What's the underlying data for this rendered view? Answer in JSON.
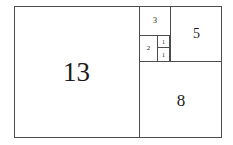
{
  "diagram": {
    "name": "fibonacci-squares",
    "type": "fibonacci-square-tiling",
    "background_color": "#ffffff",
    "line_color": "#4d4d4d",
    "text_color": "#1c1c1c",
    "frame": {
      "x": 14,
      "y": 6,
      "width": 208,
      "height": 132
    },
    "squares": [
      {
        "label": "13",
        "x": 14,
        "y": 6,
        "width": 126,
        "height": 132,
        "font_size": 27
      },
      {
        "label": "8",
        "x": 140,
        "y": 61,
        "width": 82,
        "height": 77,
        "font_size": 17
      },
      {
        "label": "5",
        "x": 170,
        "y": 6,
        "width": 52,
        "height": 55,
        "font_size": 14
      },
      {
        "label": "3",
        "x": 140,
        "y": 6,
        "width": 30,
        "height": 30,
        "font_size": 8
      },
      {
        "label": "2",
        "x": 140,
        "y": 36,
        "width": 18,
        "height": 25,
        "font_size": 7
      },
      {
        "label": "1",
        "x": 158,
        "y": 36,
        "width": 12,
        "height": 12,
        "font_size": 6
      },
      {
        "label": "1",
        "x": 158,
        "y": 48,
        "width": 12,
        "height": 13,
        "font_size": 6
      }
    ]
  },
  "chart_data": {
    "type": "table",
    "title": "",
    "categories": [
      "13",
      "8",
      "5",
      "3",
      "2",
      "1",
      "1"
    ],
    "values": [
      13,
      8,
      5,
      3,
      2,
      1,
      1
    ],
    "xlabel": "",
    "ylabel": "",
    "legend": []
  }
}
